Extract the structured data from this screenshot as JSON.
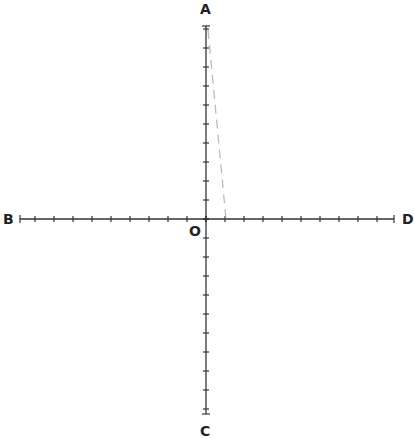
{
  "labels": {
    "top": "A",
    "left": "B",
    "bottom": "C",
    "right": "D",
    "origin": "O"
  },
  "axes": {
    "horizontal": {
      "x1": 20,
      "x2": 394,
      "y": 219,
      "tick_spacing": 19
    },
    "vertical": {
      "x": 206,
      "y1": 26,
      "y2": 414,
      "tick_spacing": 19
    }
  },
  "dashed_line": {
    "x1": 208,
    "y1": 30,
    "x2": 226,
    "y2": 219,
    "color": "#bbbbbb"
  },
  "colors": {
    "axis": "#333333"
  }
}
